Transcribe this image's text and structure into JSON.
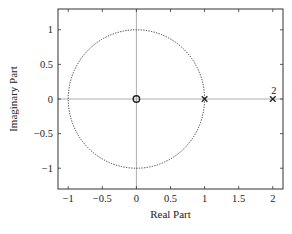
{
  "chart_data": {
    "type": "scatter",
    "subtype": "pole-zero plot",
    "title": "",
    "xlabel": "Real Part",
    "ylabel": "Imaginary Part",
    "xlim": [
      -1.15,
      2.15
    ],
    "ylim": [
      -1.3,
      1.3
    ],
    "xticks": [
      -1,
      -0.5,
      0,
      0.5,
      1,
      1.5,
      2
    ],
    "xtick_labels": [
      "−1",
      "−0.5",
      "0",
      "0.5",
      "1",
      "1.5",
      "2"
    ],
    "yticks": [
      1,
      0.5,
      0,
      -0.5,
      -1
    ],
    "ytick_labels": [
      "1",
      "0.5",
      "0",
      "−0.5",
      "−1"
    ],
    "grid": false,
    "unit_circle": {
      "center": [
        0,
        0
      ],
      "radius": 1,
      "style": "dotted"
    },
    "series": [
      {
        "name": "zeros",
        "marker": "o",
        "points": [
          {
            "x": 0,
            "y": 0,
            "multiplicity": 1
          }
        ]
      },
      {
        "name": "poles",
        "marker": "x",
        "points": [
          {
            "x": 1,
            "y": 0,
            "multiplicity": 1
          },
          {
            "x": 2,
            "y": 0,
            "multiplicity": 2,
            "label": "2"
          }
        ]
      }
    ],
    "caption": "Fig. (partially illegible caption)"
  },
  "colors": {
    "axis": "#333333",
    "reference_lines": "#9a9a9a",
    "circle": "#333333",
    "markers": "#222222"
  }
}
